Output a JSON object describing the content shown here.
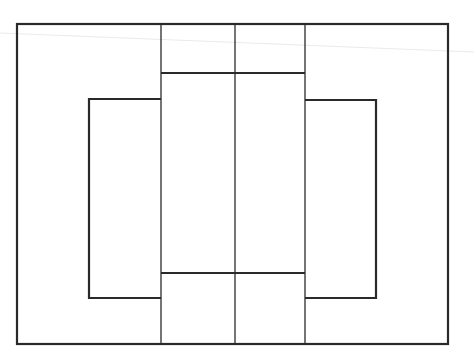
{
  "diagram": {
    "width": 474,
    "height": 361,
    "background": "#ffffff",
    "stroke_color": "#2a2a2a",
    "artifact_color": "#e4e4e4",
    "outer_frame": {
      "x1": 17,
      "y1": 24,
      "x2": 448,
      "y2": 344,
      "stroke_width": 2.2
    },
    "vertical_dividers": [
      {
        "name": "left-divider",
        "x": 161,
        "y1": 24,
        "y2": 344,
        "stroke_width": 1.3
      },
      {
        "name": "center-divider",
        "x": 235,
        "y1": 24,
        "y2": 344,
        "stroke_width": 1.3
      },
      {
        "name": "right-divider",
        "x": 305,
        "y1": 24,
        "y2": 344,
        "stroke_width": 1.3
      }
    ],
    "horizontal_bars": [
      {
        "name": "upper-bar",
        "y": 73,
        "x1": 161,
        "x2": 305,
        "stroke_width": 2
      },
      {
        "name": "lower-bar",
        "y": 273,
        "x1": 161,
        "x2": 305,
        "stroke_width": 2
      }
    ],
    "side_brackets": [
      {
        "name": "left-bracket",
        "points": "161,99 89,99 89,298 161,298",
        "stroke_width": 2.2
      },
      {
        "name": "right-bracket",
        "points": "305,100 376,100 376,298 305,298",
        "stroke_width": 2.2
      }
    ],
    "scan_artifact": {
      "x1": 0,
      "y1": 33,
      "x2": 474,
      "y2": 52,
      "stroke_width": 0.8
    }
  }
}
